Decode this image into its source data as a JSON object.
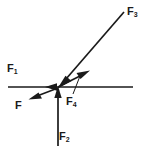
{
  "diagram": {
    "type": "free-body-force-diagram",
    "background_color": "#ffffff",
    "stroke_color": "#1a1a1a",
    "width": 147,
    "height": 157,
    "origin": {
      "x": 57,
      "y": 87
    },
    "labels": {
      "f1": {
        "base": "F",
        "sub": "1"
      },
      "f2": {
        "base": "F",
        "sub": "2"
      },
      "f3": {
        "base": "F",
        "sub": "3"
      },
      "f4": {
        "base": "F",
        "sub": "4"
      },
      "f": {
        "base": "F",
        "sub": ""
      }
    },
    "vectors": [
      {
        "name": "F1",
        "label": "F₁",
        "description": "horizontal line pointing left toward the origin",
        "from": {
          "x": 133,
          "y": 87
        },
        "to": {
          "x": 8,
          "y": 87
        },
        "arrowhead": "left-at-origin",
        "angle_deg": 180
      },
      {
        "name": "F2",
        "label": "F₂",
        "description": "vertical arrow pointing up into the origin",
        "from": {
          "x": 58,
          "y": 146
        },
        "to": {
          "x": 58,
          "y": 89
        },
        "arrowhead": "up",
        "angle_deg": 90
      },
      {
        "name": "F3",
        "label": "F₃",
        "description": "long arrow from upper right pointing down-left into the origin",
        "from": {
          "x": 124,
          "y": 12
        },
        "to": {
          "x": 58,
          "y": 88
        },
        "arrowhead": "down-left-at-origin",
        "angle_deg": 229
      },
      {
        "name": "F4",
        "label": "F₄",
        "description": "short arrow from origin pointing up-right",
        "from": {
          "x": 58,
          "y": 87
        },
        "to": {
          "x": 89,
          "y": 71
        },
        "arrowhead": "up-right",
        "angle_deg": 27
      },
      {
        "name": "F",
        "label": "F",
        "description": "short arrow from origin pointing down-left",
        "from": {
          "x": 58,
          "y": 88
        },
        "to": {
          "x": 29,
          "y": 99
        },
        "arrowhead": "down-left",
        "angle_deg": 201
      }
    ],
    "leader_lines": [
      {
        "name": "f4-leader",
        "description": "thin leader connecting the F4 label to the F4 arrow shaft",
        "from": {
          "x": 73,
          "y": 94
        },
        "to": {
          "x": 80,
          "y": 76
        }
      }
    ]
  }
}
